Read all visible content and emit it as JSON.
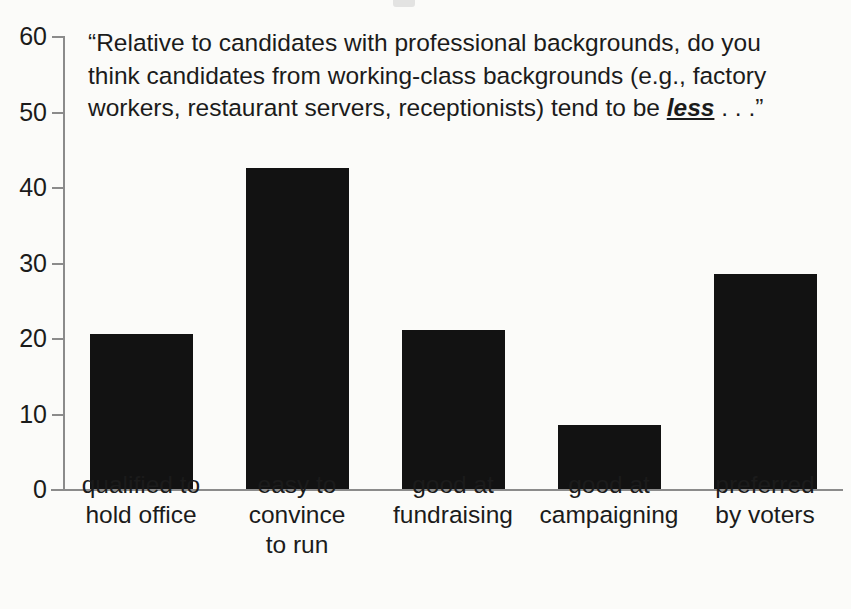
{
  "chart_data": {
    "type": "bar",
    "title": "",
    "annotation": {
      "open_quote": "“",
      "line1": "Relative to candidates with professional backgrounds, do you think",
      "line2": "candidates from working-class backgrounds (e.g., factory workers, restaurant",
      "line3_before": "servers, receptionists) tend to be ",
      "emphasis": "less",
      "line3_after": " . . .",
      "close_quote": "”"
    },
    "categories": [
      "qualified to\nhold office",
      "easy to\nconvince\nto run",
      "good at\nfundraising",
      "good at\ncampaigning",
      "preferred\nby voters"
    ],
    "category_lines": [
      [
        "qualified to",
        "hold office"
      ],
      [
        "easy to",
        "convince",
        "to run"
      ],
      [
        "good at",
        "fundraising"
      ],
      [
        "good at",
        "campaigning"
      ],
      [
        "preferred",
        "by voters"
      ]
    ],
    "values": [
      20.5,
      42.5,
      21,
      8.5,
      28.5
    ],
    "xlabel": "",
    "ylabel": "",
    "ylim": [
      0,
      60
    ],
    "yticks": [
      0,
      10,
      20,
      30,
      40,
      50,
      60
    ],
    "ytick_labels": [
      "0",
      "10",
      "20",
      "30",
      "40",
      "50",
      "60"
    ],
    "grid": false,
    "legend": null,
    "colors": {
      "bar": "#121212",
      "axis": "#8b8b8b",
      "text": "#1b1b1b",
      "background": "#fbfbf9"
    }
  }
}
